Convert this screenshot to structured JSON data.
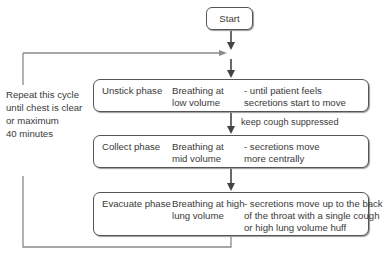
{
  "start": {
    "label": "Start"
  },
  "loop_note": {
    "lines": [
      "Repeat this cycle",
      "until chest is clear",
      "or maximum",
      "40 minutes"
    ]
  },
  "phases": [
    {
      "name": "Unstick phase",
      "breathing": [
        "Breathing at",
        "low volume"
      ],
      "effect": [
        "- until patient feels",
        "secretions start to move"
      ]
    },
    {
      "name": "Collect phase",
      "breathing": [
        "Breathing at",
        "mid volume"
      ],
      "effect": [
        "- secretions move",
        "more centrally"
      ]
    },
    {
      "name": "Evacuate phase",
      "breathing": [
        "Breathing at high",
        "lung volume"
      ],
      "effect": [
        "- secretions move up to the back",
        "of the throat with a single cough",
        "or high lung volume huff"
      ]
    }
  ],
  "transitions": {
    "unstick_to_collect": "keep cough suppressed"
  },
  "colors": {
    "line": "#555555",
    "loop_line": "#8a8a8a",
    "text": "#3a3a3a"
  }
}
